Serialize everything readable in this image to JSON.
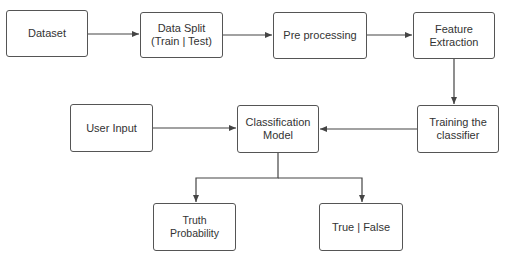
{
  "diagram": {
    "nodes": [
      {
        "id": "dataset",
        "label": "Dataset"
      },
      {
        "id": "split",
        "label": "Data Split (Train | Test)"
      },
      {
        "id": "preprocess",
        "label": "Pre processing"
      },
      {
        "id": "features",
        "label": "Feature Extraction"
      },
      {
        "id": "training",
        "label": "Training the classifier"
      },
      {
        "id": "model",
        "label": "Classification Model"
      },
      {
        "id": "user_input",
        "label": "User Input"
      },
      {
        "id": "truth_prob",
        "label": "Truth Probability"
      },
      {
        "id": "true_false",
        "label": "True | False"
      }
    ],
    "edges": [
      {
        "from": "dataset",
        "to": "split"
      },
      {
        "from": "split",
        "to": "preprocess"
      },
      {
        "from": "preprocess",
        "to": "features"
      },
      {
        "from": "features",
        "to": "training"
      },
      {
        "from": "training",
        "to": "model"
      },
      {
        "from": "user_input",
        "to": "model"
      },
      {
        "from": "model",
        "to": "truth_prob"
      },
      {
        "from": "model",
        "to": "true_false"
      }
    ]
  }
}
